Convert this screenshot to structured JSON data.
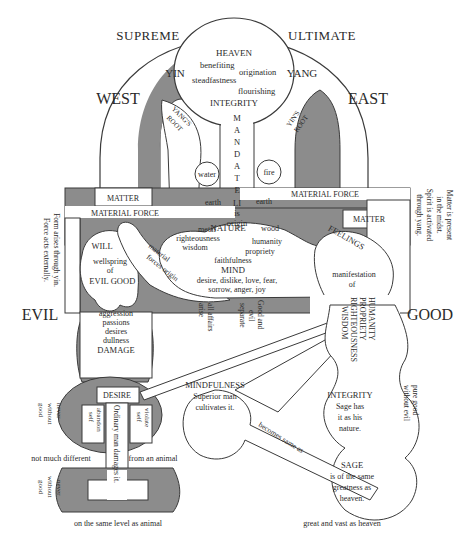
{
  "colors": {
    "shade": "#8c8c8c",
    "line": "#3a3a3a",
    "paper": "#ffffff",
    "ink": "#2a2a2a"
  },
  "corners": {
    "top_left": "SUPREME",
    "top_right": "ULTIMATE"
  },
  "directions": {
    "west": "WEST",
    "east": "EAST",
    "evil": "EVIL",
    "good": "GOOD"
  },
  "heaven": {
    "title": "HEAVEN",
    "virtues": [
      "benefiting",
      "origination",
      "steadfastness",
      "flourishing"
    ],
    "integrity": "INTEGRITY"
  },
  "yin": "YIN",
  "yang": "YANG",
  "yangs_root": [
    "YANG'S",
    "ROOT"
  ],
  "yins_root": [
    "YIN'S",
    "ROOT"
  ],
  "mandate": {
    "letters": [
      "M",
      "A",
      "N",
      "D",
      "A",
      "T",
      "E"
    ],
    "li": "LI",
    "is": "is",
    "origin": "origin"
  },
  "elements_left": [
    "water",
    "earth",
    "metal"
  ],
  "elements_right": [
    "fire",
    "earth",
    "wood"
  ],
  "matter_left": "MATTER",
  "matter_right": "MATTER",
  "material_force_left": "MATERIAL FORCE",
  "material_force_right": "MATERIAL FORCE",
  "side_note_left": [
    "Form arises through yin.",
    "Force acts externally."
  ],
  "side_note_right": [
    "Matter is present",
    "in the midst.",
    "Spirit is activated",
    "through yang."
  ],
  "will": {
    "title": "WILL",
    "line1": "wellspring",
    "line2": "of",
    "evil": "EVIL",
    "good": "GOOD"
  },
  "material_forces_origin": [
    "material",
    "forces origin"
  ],
  "nature": {
    "title": "NATURE",
    "virtues": [
      "righteousness",
      "humanity",
      "wisdom",
      "propriety",
      "faithfulness"
    ]
  },
  "mind": {
    "title": "MIND",
    "emotions_1": "desire, dislike, love, fear,",
    "emotions_2": "sorrow, anger, joy"
  },
  "feelings": {
    "title": "FEELINGS",
    "manifestation": "manifestation",
    "of": "of"
  },
  "four_virtues": [
    "HUMANITY",
    "PROPRIETY",
    "RIGHTEOUSNESS",
    "WISDOM"
  ],
  "middle_notes": {
    "all_affairs": [
      "all affairs",
      "arise"
    ],
    "good_evil": [
      "Good and",
      "evil",
      "separate"
    ]
  },
  "damage": {
    "items": [
      "aggression",
      "passions",
      "desires",
      "dullness"
    ],
    "title": "DAMAGE"
  },
  "desire": {
    "title": "DESIRE",
    "abandon": [
      "abandon",
      "self"
    ],
    "violate": [
      "violate",
      "self"
    ],
    "ordinary": "Ordinary man damages it."
  },
  "never_without_good_1": [
    "never",
    "without",
    "good"
  ],
  "never_without_good_2": [
    "never",
    "without",
    "good"
  ],
  "not_much_different": "not much different",
  "from_an_animal": "from an animal",
  "same_level_animal": "on the same level as animal",
  "mindfulness": {
    "title": "MINDFULNESS",
    "line1": "Superior man",
    "line2": "cultivates it."
  },
  "becomes_same_as": "becomes same as",
  "integrity_sage": {
    "title": "INTEGRITY",
    "line1": "Sage has",
    "line2": "it as his",
    "line3": "nature."
  },
  "pure_good": [
    "pure good",
    "without evil"
  ],
  "sage": {
    "title": "SAGE",
    "line1": "is of the same",
    "line2": "greatness as",
    "line3": "heaven."
  },
  "great_vast": "great and vast as heaven"
}
